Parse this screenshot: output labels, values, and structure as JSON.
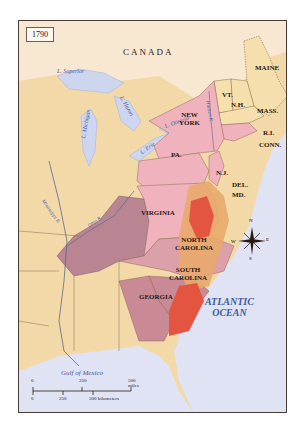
{
  "map": {
    "year": "1790",
    "country_label": "CANADA",
    "states": [
      {
        "id": "maine",
        "label": "MAINE"
      },
      {
        "id": "vt",
        "label": "VT."
      },
      {
        "id": "nh",
        "label": "N.H."
      },
      {
        "id": "mass",
        "label": "MASS."
      },
      {
        "id": "ri",
        "label": "R.I."
      },
      {
        "id": "conn",
        "label": "CONN."
      },
      {
        "id": "ny",
        "label": "NEW\nYORK"
      },
      {
        "id": "pa",
        "label": "PA."
      },
      {
        "id": "nj",
        "label": "N.J."
      },
      {
        "id": "del",
        "label": "DEL."
      },
      {
        "id": "md",
        "label": "MD."
      },
      {
        "id": "va",
        "label": "VIRGINIA"
      },
      {
        "id": "nc",
        "label": "NORTH\nCAROLINA"
      },
      {
        "id": "sc",
        "label": "SOUTH\nCAROLINA"
      },
      {
        "id": "ga",
        "label": "GEORGIA"
      }
    ],
    "water_labels": {
      "superior": "L. Superior",
      "michigan": "L. Michigan",
      "huron": "L. Huron",
      "ontario": "L. Ontario",
      "erie": "L. Erie",
      "hudson": "Hudson R.",
      "mississippi": "Mississippi R.",
      "ohio": "Ohio R.",
      "atlantic": "ATLANTIC\nOCEAN",
      "gulf": "Gulf of Mexico"
    },
    "compass": {
      "n": "N",
      "s": "S",
      "e": "E",
      "w": "W"
    },
    "scale": {
      "miles_ticks": [
        "0",
        "250",
        "500 miles"
      ],
      "km_ticks": [
        "0",
        "250",
        "500 kilometers"
      ]
    },
    "colors": {
      "water": "#dfe3f3",
      "land_other": "#f4d9a8",
      "states_pink": "#f0b3bd",
      "new_england": "#f5e0ad",
      "western_claims": "#b98593",
      "density_light": "#e8a86a",
      "density_dark": "#e4553f",
      "frame": "#4a3b36"
    }
  }
}
